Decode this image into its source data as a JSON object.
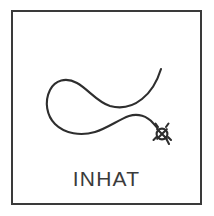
{
  "card": {
    "label": "pictogram-card",
    "background_color": "#ffffff",
    "border_color": "#3a3a3a",
    "ink_color": "#2e2e2e"
  },
  "caption": {
    "text": "INHAT"
  },
  "illustration": {
    "title": "looped-string-with-knot",
    "description": "Hand-drawn open loop of string crossing itself, with a small knot marked by an X inside a circle at the lower right end",
    "stroke_color": "#2e2e2e",
    "stroke_width": "2",
    "parts": {
      "loop_curve": "large open loop forming a figure-eight style crossing",
      "free_end_upper": "tail rising to upper right",
      "knot_mark": "small circle crossed by an X at the lower-right terminus"
    }
  }
}
